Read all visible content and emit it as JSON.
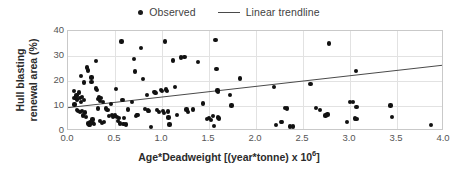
{
  "legend": {
    "entries": [
      {
        "label": "Observed",
        "marker": "dot",
        "color": "#111111"
      },
      {
        "label": "Linear trendline",
        "marker": "line",
        "color": "#4a4a4a"
      }
    ]
  },
  "axes": {
    "y_title_line1": "Hull blasting",
    "y_title_line2": "renewal area (%)",
    "y_title": "Hull blasting\nrenewal area (%)",
    "x_title_main": "Age*Deadweight [(year*tonne) x 10",
    "x_title_exponent": "6",
    "x_title_tail": "]",
    "y_ticks": [
      "0",
      "10",
      "20",
      "30",
      "40"
    ],
    "x_ticks": [
      "0.0",
      "0.5",
      "1.0",
      "1.5",
      "2.0",
      "2.5",
      "3.0",
      "3.5",
      "4.0"
    ]
  },
  "chart_data": {
    "type": "scatter",
    "title": "",
    "xlabel": "Age*Deadweight [(year*tonne) x 10^6]",
    "ylabel": "Hull blasting renewal area (%)",
    "xlim": [
      0.0,
      4.0
    ],
    "ylim": [
      0,
      40
    ],
    "xticks": [
      0.0,
      0.5,
      1.0,
      1.5,
      2.0,
      2.5,
      3.0,
      3.5,
      4.0
    ],
    "yticks": [
      0,
      10,
      20,
      30,
      40
    ],
    "grid": true,
    "legend_position": "top-center",
    "series": [
      {
        "name": "Observed",
        "type": "scatter",
        "marker": "circle",
        "color": "#111111",
        "points": [
          [
            0.06,
            16.0
          ],
          [
            0.07,
            13.2
          ],
          [
            0.07,
            10.6
          ],
          [
            0.09,
            14.2
          ],
          [
            0.1,
            12.6
          ],
          [
            0.1,
            8.4
          ],
          [
            0.11,
            8.0
          ],
          [
            0.12,
            15.4
          ],
          [
            0.13,
            13.3
          ],
          [
            0.13,
            7.7
          ],
          [
            0.14,
            22.1
          ],
          [
            0.14,
            11.6
          ],
          [
            0.15,
            13.6
          ],
          [
            0.15,
            8.0
          ],
          [
            0.16,
            6.2
          ],
          [
            0.17,
            19.4
          ],
          [
            0.17,
            12.4
          ],
          [
            0.18,
            7.4
          ],
          [
            0.19,
            5.6
          ],
          [
            0.2,
            25.4
          ],
          [
            0.21,
            24.2
          ],
          [
            0.21,
            3.0
          ],
          [
            0.22,
            2.3
          ],
          [
            0.23,
            3.6
          ],
          [
            0.23,
            2.6
          ],
          [
            0.25,
            21.4
          ],
          [
            0.25,
            19.6
          ],
          [
            0.26,
            4.6
          ],
          [
            0.27,
            3.2
          ],
          [
            0.28,
            2.9
          ],
          [
            0.3,
            27.9
          ],
          [
            0.3,
            17.0
          ],
          [
            0.31,
            16.3
          ],
          [
            0.32,
            12.8
          ],
          [
            0.32,
            9.0
          ],
          [
            0.33,
            13.5
          ],
          [
            0.34,
            12.0
          ],
          [
            0.34,
            3.9
          ],
          [
            0.35,
            13.2
          ],
          [
            0.36,
            3.3
          ],
          [
            0.37,
            11.6
          ],
          [
            0.38,
            3.7
          ],
          [
            0.4,
            9.0
          ],
          [
            0.42,
            8.5
          ],
          [
            0.44,
            6.0
          ],
          [
            0.46,
            10.9
          ],
          [
            0.47,
            6.4
          ],
          [
            0.48,
            5.5
          ],
          [
            0.49,
            5.9
          ],
          [
            0.5,
            6.2
          ],
          [
            0.51,
            16.8
          ],
          [
            0.52,
            5.6
          ],
          [
            0.53,
            4.1
          ],
          [
            0.54,
            5.2
          ],
          [
            0.55,
            3.0
          ],
          [
            0.57,
            35.8
          ],
          [
            0.58,
            12.4
          ],
          [
            0.59,
            2.9
          ],
          [
            0.6,
            5.3
          ],
          [
            0.62,
            2.6
          ],
          [
            0.64,
            8.6
          ],
          [
            0.68,
            11.5
          ],
          [
            0.7,
            28.7
          ],
          [
            0.71,
            23.8
          ],
          [
            0.72,
            6.0
          ],
          [
            0.73,
            6.3
          ],
          [
            0.74,
            6.5
          ],
          [
            0.78,
            33.3
          ],
          [
            0.8,
            20.9
          ],
          [
            0.82,
            8.9
          ],
          [
            0.84,
            14.4
          ],
          [
            0.85,
            8.2
          ],
          [
            0.86,
            7.9
          ],
          [
            0.88,
            1.6
          ],
          [
            0.92,
            15.5
          ],
          [
            0.93,
            15.3
          ],
          [
            0.95,
            8.4
          ],
          [
            0.97,
            7.6
          ],
          [
            0.99,
            16.4
          ],
          [
            1.0,
            16.0
          ],
          [
            1.01,
            8.0
          ],
          [
            1.02,
            7.2
          ],
          [
            1.03,
            35.8
          ],
          [
            1.04,
            16.6
          ],
          [
            1.05,
            16.0
          ],
          [
            1.06,
            7.8
          ],
          [
            1.07,
            5.4
          ],
          [
            1.08,
            2.6
          ],
          [
            1.12,
            28.2
          ],
          [
            1.14,
            17.5
          ],
          [
            1.16,
            6.4
          ],
          [
            1.2,
            29.4
          ],
          [
            1.24,
            29.5
          ],
          [
            1.26,
            8.6
          ],
          [
            1.28,
            7.7
          ],
          [
            1.33,
            8.6
          ],
          [
            1.38,
            27.6
          ],
          [
            1.44,
            11.0
          ],
          [
            1.48,
            4.8
          ],
          [
            1.5,
            5.2
          ],
          [
            1.52,
            4.5
          ],
          [
            1.54,
            5.9
          ],
          [
            1.55,
            2.0
          ],
          [
            1.57,
            36.3
          ],
          [
            1.58,
            24.8
          ],
          [
            1.59,
            16.2
          ],
          [
            1.6,
            15.6
          ],
          [
            1.6,
            5.4
          ],
          [
            1.61,
            5.0
          ],
          [
            1.72,
            14.3
          ],
          [
            1.74,
            10.2
          ],
          [
            1.83,
            21.0
          ],
          [
            2.19,
            17.7
          ],
          [
            2.21,
            2.4
          ],
          [
            2.27,
            3.7
          ],
          [
            2.28,
            3.6
          ],
          [
            2.31,
            9.2
          ],
          [
            2.33,
            9.0
          ],
          [
            2.36,
            1.8
          ],
          [
            2.39,
            1.8
          ],
          [
            2.58,
            18.8
          ],
          [
            2.64,
            9.3
          ],
          [
            2.68,
            8.4
          ],
          [
            2.74,
            6.2
          ],
          [
            2.76,
            6.6
          ],
          [
            2.78,
            35.0
          ],
          [
            2.97,
            3.6
          ],
          [
            3.0,
            11.6
          ],
          [
            3.03,
            11.7
          ],
          [
            3.05,
            5.0
          ],
          [
            3.06,
            24.1
          ],
          [
            3.07,
            9.6
          ],
          [
            3.07,
            4.7
          ],
          [
            3.43,
            10.2
          ],
          [
            3.45,
            5.7
          ],
          [
            3.86,
            2.4
          ]
        ]
      },
      {
        "name": "Linear trendline",
        "type": "line",
        "color": "#4a4a4a",
        "endpoints": [
          [
            0.0,
            8.7
          ],
          [
            4.0,
            26.0
          ]
        ]
      }
    ]
  }
}
